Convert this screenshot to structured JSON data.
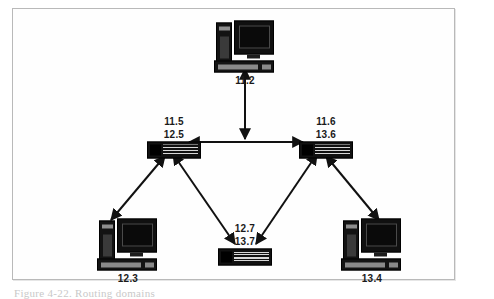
{
  "figure": {
    "caption": "Figure 4-22. Routing domains",
    "panel_border_color": "#b9b9b9",
    "background_color": "#ffffff",
    "ink_color": "#111111"
  },
  "diagram": {
    "type": "network-topology",
    "nodes": [
      {
        "id": "pc-top",
        "kind": "computer",
        "icon": "desktop-computer-icon",
        "label_lines": [
          "11.2"
        ],
        "label_position": "below",
        "x": 244,
        "y": 42
      },
      {
        "id": "switch-left",
        "kind": "switch",
        "icon": "network-switch-icon",
        "label_lines": [
          "11.5",
          "12.5"
        ],
        "label_position": "above",
        "x": 173,
        "y": 150
      },
      {
        "id": "switch-right",
        "kind": "switch",
        "icon": "network-switch-icon",
        "label_lines": [
          "11.6",
          "13.6"
        ],
        "label_position": "above",
        "x": 322,
        "y": 150
      },
      {
        "id": "switch-bottom",
        "kind": "switch",
        "icon": "network-switch-icon",
        "label_lines": [
          "12.7",
          "13.7"
        ],
        "label_position": "above",
        "x": 250,
        "y": 258
      },
      {
        "id": "pc-bottom-left",
        "kind": "computer",
        "icon": "desktop-computer-icon",
        "label_lines": [
          "12.3"
        ],
        "label_position": "below",
        "x": 127,
        "y": 240
      },
      {
        "id": "pc-bottom-right",
        "kind": "computer",
        "icon": "desktop-computer-icon",
        "label_lines": [
          "13.4"
        ],
        "label_position": "below",
        "x": 371,
        "y": 240
      }
    ],
    "links": [
      {
        "id": "link-top-to-bus",
        "from": "pc-top",
        "to": "bus-midpoint",
        "arrows": "both",
        "orientation": "vertical"
      },
      {
        "id": "link-switch-left-right",
        "from": "switch-left",
        "to": "switch-right",
        "arrows": "both",
        "orientation": "horizontal"
      },
      {
        "id": "link-switch-left-pc-left",
        "from": "switch-left",
        "to": "pc-bottom-left",
        "arrows": "both",
        "orientation": "diagonal"
      },
      {
        "id": "link-switch-left-switch-bottom",
        "from": "switch-left",
        "to": "switch-bottom",
        "arrows": "both",
        "orientation": "diagonal"
      },
      {
        "id": "link-switch-right-pc-right",
        "from": "switch-right",
        "to": "pc-bottom-right",
        "arrows": "both",
        "orientation": "diagonal"
      },
      {
        "id": "link-switch-right-switch-bottom",
        "from": "switch-right",
        "to": "switch-bottom",
        "arrows": "both",
        "orientation": "diagonal"
      }
    ]
  }
}
